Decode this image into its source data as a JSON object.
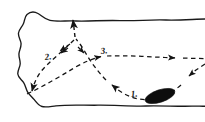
{
  "figure": {
    "background_color": "#ffffff",
    "ink_color": "#141414",
    "width": 205,
    "height": 122
  },
  "region": {
    "name": "irregular-outline",
    "description": "Hand-drawn wavy closed boundary open at right edge",
    "stroke_color": "#1a1a1a",
    "fill_color": "#ffffff"
  },
  "obstacle": {
    "name": "filled-ellipse",
    "label": "1.",
    "fill_color": "#0d0d0d",
    "center_x": 160,
    "center_y": 96,
    "rx": 15,
    "ry": 6,
    "rotation_deg": -18
  },
  "paths": [
    {
      "id": "path-1",
      "label": "1.",
      "label_x": 133,
      "label_y": 95,
      "style": "dashed",
      "description": "Curve entering from lower right, sweeping left past the ellipse and up toward the central junction"
    },
    {
      "id": "path-2",
      "label": "2.",
      "label_x": 47,
      "label_y": 59,
      "style": "dashed",
      "description": "Diagonal dashed line from central junction down-left toward lower left corner"
    },
    {
      "id": "path-3",
      "label": "3.",
      "label_x": 104,
      "label_y": 53,
      "style": "dashed",
      "description": "Near-horizontal dashed line running to the right edge with arrowhead"
    }
  ],
  "arrowheads": [
    {
      "name": "arrow-up-top",
      "x": 73,
      "y": 15,
      "direction": "up"
    },
    {
      "name": "arrow-down-left-lower",
      "x": 28,
      "y": 95,
      "direction": "down-left"
    },
    {
      "name": "arrow-right-edge",
      "x": 178,
      "y": 58,
      "direction": "right"
    },
    {
      "name": "arrow-right-junction",
      "x": 105,
      "y": 57,
      "direction": "right"
    },
    {
      "name": "arrow-up-left-curve",
      "x": 109,
      "y": 82,
      "direction": "up-left"
    },
    {
      "name": "arrow-down-left-incoming",
      "x": 183,
      "y": 82,
      "direction": "down-left"
    },
    {
      "name": "arrow-down-left-inner",
      "x": 55,
      "y": 72,
      "direction": "down-left"
    },
    {
      "name": "arrow-up-left-branch",
      "x": 58,
      "y": 52,
      "direction": "up-left"
    },
    {
      "name": "arrow-up-right-branch",
      "x": 83,
      "y": 52,
      "direction": "up-right"
    }
  ],
  "labels": {
    "one": "1.",
    "two": "2.",
    "three": "3."
  }
}
